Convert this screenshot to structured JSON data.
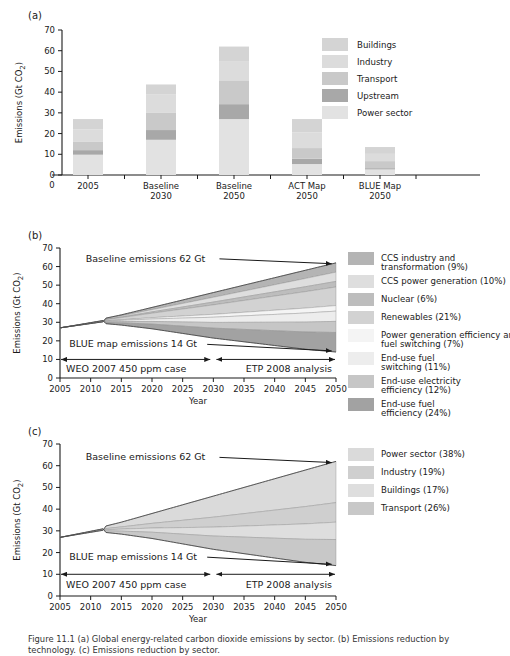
{
  "figure": {
    "caption": "Figure 11.1 (a) Global energy-related carbon dioxide emissions by sector. (b) Emissions reduction by technology. (c) Emissions reduction by sector."
  },
  "panels": [
    {
      "tag": "(a)",
      "ylabel": "Emissions (Gt CO2)",
      "ylabel_sub": "2",
      "yticks": [
        0,
        10,
        20,
        30,
        40,
        50,
        60,
        70
      ],
      "xorigin_label": "0",
      "legend": [
        {
          "label": "Buildings",
          "color": "#d4d4d4"
        },
        {
          "label": "Industry",
          "color": "#dcdcdc"
        },
        {
          "label": "Transport",
          "color": "#c9c9c9"
        },
        {
          "label": "Upstream",
          "color": "#a8a8a8"
        },
        {
          "label": "Power sector",
          "color": "#e2e2e2"
        }
      ]
    },
    {
      "tag": "(b)",
      "ylabel": "Emissions (Gt CO2)",
      "xlabel": "Year",
      "yticks": [
        0,
        10,
        20,
        30,
        40,
        50,
        60,
        70
      ],
      "xticks": [
        2005,
        2010,
        2015,
        2020,
        2025,
        2030,
        2035,
        2040,
        2045,
        2050
      ],
      "annotations": {
        "baseline": "Baseline emissions 62 Gt",
        "blue": "BLUE map emissions 14 Gt",
        "left_period": "WEO 2007 450 ppm case",
        "right_period": "ETP 2008 analysis"
      },
      "legend": [
        {
          "label": "CCS industry and transformation (9%)",
          "color": "#b4b4b4"
        },
        {
          "label": "CCS power generation (10%)",
          "color": "#dedede"
        },
        {
          "label": "Nuclear (6%)",
          "color": "#bdbdbd"
        },
        {
          "label": "Renewables (21%)",
          "color": "#d2d2d2"
        },
        {
          "label": "Power generation efficiency and fuel switching (7%)",
          "color": "#f4f4f4"
        },
        {
          "label": "End-use fuel switching (11%)",
          "color": "#ededed"
        },
        {
          "label": "End-use electricity efficiency (12%)",
          "color": "#c6c6c6"
        },
        {
          "label": "End-use fuel efficiency (24%)",
          "color": "#a2a2a2"
        }
      ]
    },
    {
      "tag": "(c)",
      "ylabel": "Emissions (Gt CO2)",
      "xlabel": "Year",
      "yticks": [
        0,
        10,
        20,
        30,
        40,
        50,
        60,
        70
      ],
      "xticks": [
        2005,
        2010,
        2015,
        2020,
        2025,
        2030,
        2035,
        2040,
        2045,
        2050
      ],
      "annotations": {
        "baseline": "Baseline emissions 62 Gt",
        "blue": "BLUE map emissions 14 Gt",
        "left_period": "WEO 2007 450 ppm case",
        "right_period": "ETP 2008 analysis"
      },
      "legend": [
        {
          "label": "Power sector (38%)",
          "color": "#dadada"
        },
        {
          "label": "Industry (19%)",
          "color": "#cfcfcf"
        },
        {
          "label": "Buildings (17%)",
          "color": "#dedede"
        },
        {
          "label": "Transport (26%)",
          "color": "#c8c8c8"
        }
      ]
    }
  ],
  "chart_data": [
    {
      "type": "bar",
      "title": "(a) Emissions by sector",
      "xlabel": "",
      "ylabel": "Emissions (Gt CO2)",
      "ylim": [
        0,
        70
      ],
      "grid": false,
      "stacked": true,
      "legend_position": "top-right",
      "categories": [
        "2005",
        "Baseline 2030",
        "Baseline 2050",
        "ACT Map 2050",
        "BLUE Map 2050"
      ],
      "series": [
        {
          "name": "Power sector",
          "values": [
            9.8,
            17.0,
            27.0,
            5.3,
            2.7
          ]
        },
        {
          "name": "Upstream",
          "values": [
            2.2,
            4.7,
            7.2,
            2.6,
            0.6
          ]
        },
        {
          "name": "Transport",
          "values": [
            4.2,
            8.5,
            11.5,
            5.1,
            3.4
          ]
        },
        {
          "name": "Industry",
          "values": [
            5.8,
            8.6,
            9.3,
            7.5,
            3.5
          ]
        },
        {
          "name": "Buildings",
          "values": [
            5.0,
            4.9,
            7.0,
            6.5,
            3.3
          ]
        }
      ],
      "totals": [
        27.0,
        43.7,
        62.0,
        27.0,
        13.5
      ]
    },
    {
      "type": "area",
      "title": "(b) Emissions reduction by technology",
      "xlabel": "Year",
      "ylabel": "Emissions (Gt CO2)",
      "ylim": [
        0,
        70
      ],
      "xlim": [
        2005,
        2050
      ],
      "grid": false,
      "legend_position": "right",
      "x": [
        2005,
        2010,
        2015,
        2020,
        2025,
        2030,
        2035,
        2040,
        2045,
        2050
      ],
      "baseline": [
        27,
        30.5,
        34,
        38,
        42,
        46,
        50,
        54,
        58,
        62
      ],
      "blue_map": [
        27,
        30.0,
        28.5,
        26.5,
        24,
        21.5,
        19.5,
        17.5,
        15.5,
        14
      ],
      "baseline_end": 62,
      "blue_end": 14,
      "series": [
        {
          "name": "CCS industry and transformation (9%)",
          "share": 9,
          "end_upper": 62.0,
          "end_lower": 57.0
        },
        {
          "name": "CCS power generation (10%)",
          "share": 10,
          "end_upper": 57.0,
          "end_lower": 52.0
        },
        {
          "name": "Nuclear (6%)",
          "share": 6,
          "end_upper": 52.0,
          "end_lower": 49.0
        },
        {
          "name": "Renewables (21%)",
          "share": 21,
          "end_upper": 49.0,
          "end_lower": 39.0
        },
        {
          "name": "Power generation efficiency and fuel switching (7%)",
          "share": 7,
          "end_upper": 39.0,
          "end_lower": 36.0
        },
        {
          "name": "End-use fuel switching (11%)",
          "share": 11,
          "end_upper": 36.0,
          "end_lower": 30.5
        },
        {
          "name": "End-use electricity efficiency (12%)",
          "share": 12,
          "end_upper": 30.5,
          "end_lower": 24.5
        },
        {
          "name": "End-use fuel efficiency (24%)",
          "share": 24,
          "end_upper": 24.5,
          "end_lower": 14.0
        }
      ]
    },
    {
      "type": "area",
      "title": "(c) Emissions reduction by sector",
      "xlabel": "Year",
      "ylabel": "Emissions (Gt CO2)",
      "ylim": [
        0,
        70
      ],
      "xlim": [
        2005,
        2050
      ],
      "grid": false,
      "legend_position": "right",
      "x": [
        2005,
        2010,
        2015,
        2020,
        2025,
        2030,
        2035,
        2040,
        2045,
        2050
      ],
      "baseline": [
        27,
        30.5,
        34,
        38,
        42,
        46,
        50,
        54,
        58,
        62
      ],
      "blue_map": [
        27,
        30.0,
        28.5,
        26.5,
        24,
        21.5,
        19.5,
        17.5,
        15.5,
        14
      ],
      "baseline_end": 62,
      "blue_end": 14,
      "series": [
        {
          "name": "Power sector (38%)",
          "share": 38,
          "end_upper": 62.0,
          "end_lower": 43.0
        },
        {
          "name": "Industry (19%)",
          "share": 19,
          "end_upper": 43.0,
          "end_lower": 34.0
        },
        {
          "name": "Buildings (17%)",
          "share": 17,
          "end_upper": 34.0,
          "end_lower": 26.0
        },
        {
          "name": "Transport (26%)",
          "share": 26,
          "end_upper": 26.0,
          "end_lower": 14.0
        }
      ]
    }
  ]
}
